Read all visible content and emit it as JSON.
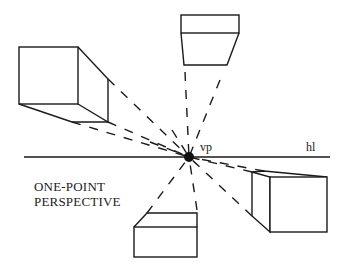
{
  "diagram": {
    "title_line1": "ONE-POINT",
    "title_line2": "PERSPECTIVE",
    "vanishing_point_label": "vp",
    "horizon_line_label": "hl",
    "stroke_color": "#1a1a1a",
    "background": "#ffffff",
    "objects": [
      "cube-top-left",
      "cube-top-center",
      "cube-bottom-center",
      "cube-bottom-right"
    ]
  }
}
